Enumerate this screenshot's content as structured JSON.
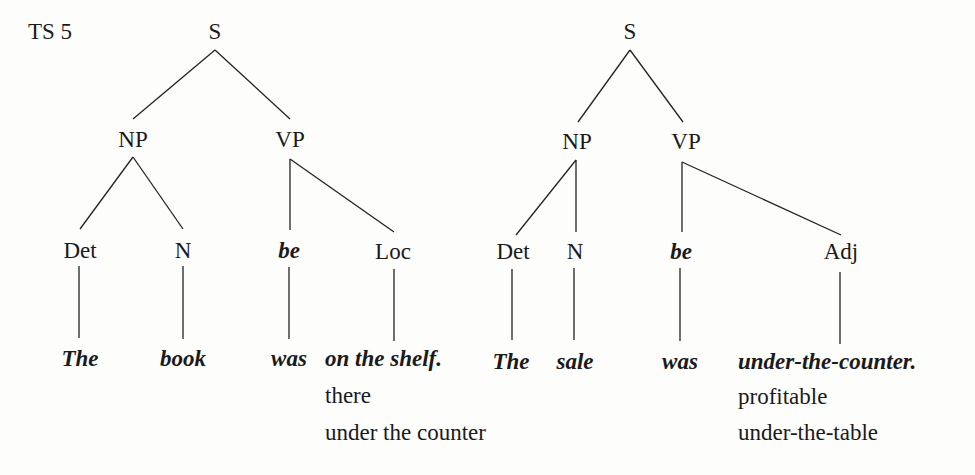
{
  "figure_label": "TS 5",
  "trees": [
    {
      "root": "S",
      "np": "NP",
      "vp": "VP",
      "det": "Det",
      "n": "N",
      "be": "be",
      "complement": "Loc",
      "leaves": {
        "det": "The",
        "n": "book",
        "be": "was",
        "complement": "on the shelf."
      },
      "alternatives": [
        "there",
        "under the counter"
      ]
    },
    {
      "root": "S",
      "np": "NP",
      "vp": "VP",
      "det": "Det",
      "n": "N",
      "be": "be",
      "complement": "Adj",
      "leaves": {
        "det": "The",
        "n": "sale",
        "be": "was",
        "complement": "under-the-counter."
      },
      "alternatives": [
        "profitable",
        "under-the-table"
      ]
    }
  ]
}
